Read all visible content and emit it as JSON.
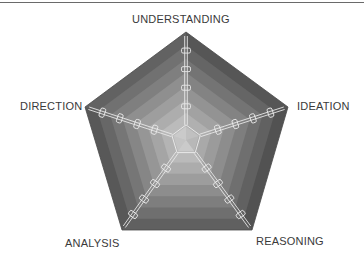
{
  "diagram": {
    "type": "pentagon-radar",
    "center": [
      186,
      140
    ],
    "vertices": [
      [
        186,
        32
      ],
      [
        288,
        107
      ],
      [
        252,
        230
      ],
      [
        122,
        230
      ],
      [
        85,
        107
      ]
    ],
    "rings": 8,
    "colors": {
      "outer": "#5a5a5a",
      "inner": "#c8c8c8",
      "spoke": "#e8e8e8",
      "label": "#3a3a3a"
    },
    "axes": [
      {
        "name": "UNDERSTANDING",
        "label_pos": [
          132,
          13
        ]
      },
      {
        "name": "IDEATION",
        "label_pos": [
          297,
          100
        ]
      },
      {
        "name": "REASONING",
        "label_pos": [
          256,
          235
        ]
      },
      {
        "name": "ANALYSIS",
        "label_pos": [
          65,
          237
        ]
      },
      {
        "name": "DIRECTION",
        "label_pos": [
          20,
          100
        ]
      }
    ],
    "ticks_per_axis": 4
  }
}
